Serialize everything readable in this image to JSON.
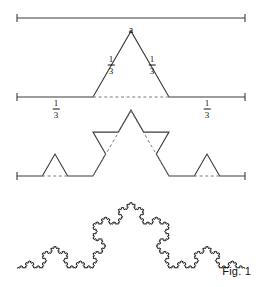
{
  "figure": {
    "caption": "Fig. 1",
    "title_label": "a",
    "stroke_color": "#3a3a3a",
    "dash_color": "#7a7a7a",
    "background": "#ffffff",
    "rows": [
      {
        "name": "initiator",
        "iteration": 0,
        "baseline_y": 18,
        "x_start": 17,
        "x_end": 245,
        "tick_half_height": 4,
        "labels": [
          {
            "kind": "plain",
            "text": "a",
            "x": 131,
            "y": 24
          }
        ]
      },
      {
        "name": "generator",
        "iteration": 1,
        "baseline_y": 97,
        "x_start": 17,
        "x_end": 245,
        "tick_half_height": 4,
        "dashed_base": {
          "x1": 93,
          "x2": 169,
          "y": 97
        },
        "labels": [
          {
            "kind": "fraction",
            "num": "1",
            "den": "3",
            "x": 56,
            "y": 109
          },
          {
            "kind": "fraction",
            "num": "1",
            "den": "3",
            "x": 111,
            "y": 65
          },
          {
            "kind": "fraction",
            "num": "1",
            "den": "3",
            "x": 152,
            "y": 65
          },
          {
            "kind": "fraction",
            "num": "1",
            "den": "3",
            "x": 207,
            "y": 109
          }
        ]
      },
      {
        "name": "second-iteration",
        "iteration": 2,
        "baseline_y": 176,
        "x_start": 17,
        "x_end": 245,
        "tick_half_height": 4,
        "dashed_segments": [
          {
            "x1": 42,
            "y1": 176,
            "x2": 68,
            "y2": 176
          },
          {
            "x1": 93,
            "y1": 176,
            "x2": 131,
            "y2": 111
          },
          {
            "x1": 131,
            "y1": 111,
            "x2": 169,
            "y2": 176
          },
          {
            "x1": 194,
            "y1": 176,
            "x2": 220,
            "y2": 176
          }
        ],
        "labels": []
      },
      {
        "name": "high-iteration",
        "iteration": 5,
        "baseline_y": 268,
        "x_start": 17,
        "x_end": 245,
        "tick_half_height": 0,
        "labels": []
      }
    ],
    "koch": {
      "span_start": 17,
      "span_end": 245,
      "peak_angle_deg": 60
    }
  }
}
